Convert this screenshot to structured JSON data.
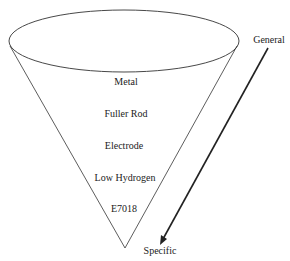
{
  "diagram": {
    "type": "funnel",
    "levels": [
      "Metal",
      "Fuller Rod",
      "Electrode",
      "Low Hydrogen",
      "E7018"
    ],
    "arrow": {
      "start_label": "General",
      "end_label": "Specific"
    }
  }
}
